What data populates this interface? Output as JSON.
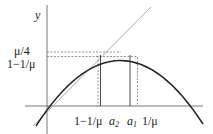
{
  "diagram": {
    "axis_y_label": "y",
    "y_ticks": [
      {
        "label": "μ/4"
      },
      {
        "label": "1−1/μ"
      }
    ],
    "x_ticks": [
      {
        "label": "1−1/μ"
      },
      {
        "label": "a",
        "sub": "2"
      },
      {
        "label": "a",
        "sub": "1"
      },
      {
        "label": "1/μ"
      }
    ],
    "elements": [
      "parabola",
      "identity-line",
      "dashed-guides",
      "vertical-markers"
    ],
    "colors": {
      "curve": "#222222",
      "identity": "#aaaaaa",
      "axis": "#333333",
      "dash": "#555555"
    }
  }
}
